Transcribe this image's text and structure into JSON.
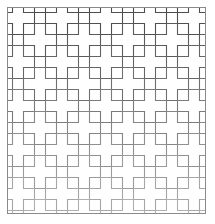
{
  "figure": {
    "background_color": "#ffffff"
  },
  "frame": {
    "name": "outer-border",
    "x": 7,
    "y": 7,
    "width": 199,
    "height": 207,
    "stroke_color": "#8a8a8a",
    "stroke_width": 1,
    "fill": "none"
  },
  "pattern": {
    "type": "tessellation",
    "motif": "greek-cross",
    "unit_cell": 33,
    "arm_thickness": 11,
    "columns": 6,
    "rows": 7,
    "lattice": "diagonal-offset",
    "row_offset": 16.5,
    "tile_fill": "#ffffff",
    "stroke_width": 1.1,
    "stroke_color_top": "#4a4a4a",
    "stroke_color_bottom": "#b0b0b0",
    "fade": "strokes darken toward the top of the panel"
  },
  "chart_data": {
    "type": "table",
    "xlabel": "",
    "ylabel": "",
    "categories": [
      "row 1",
      "row 2",
      "row 3",
      "row 4",
      "row 5",
      "row 6",
      "row 7"
    ],
    "values": [
      6,
      6,
      6,
      6,
      6,
      6,
      6
    ],
    "series": [
      {
        "name": "crosses per row",
        "values": [
          6,
          6,
          6,
          6,
          6,
          6,
          6
        ]
      },
      {
        "name": "stroke darkness (0-100)",
        "values": [
          72,
          65,
          58,
          50,
          42,
          34,
          26
        ]
      }
    ]
  }
}
